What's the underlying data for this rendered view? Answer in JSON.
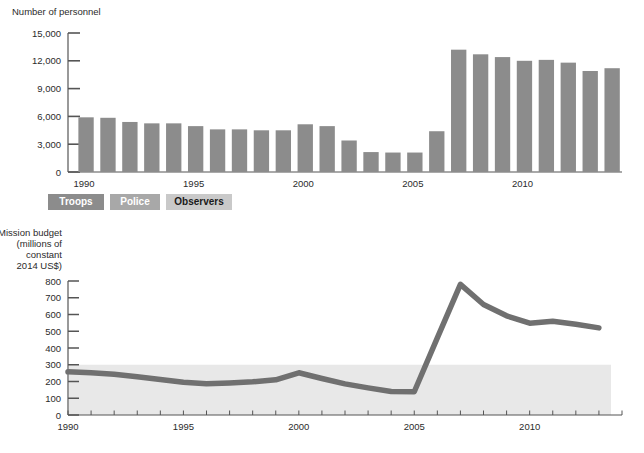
{
  "figure": {
    "background": "#ffffff",
    "bar_color": "#8c8c8c",
    "line_color": "#707070",
    "band_color": "#e8e8e8",
    "axis_color": "#555555"
  },
  "legend": {
    "items": [
      {
        "label": "Troops",
        "bg": "#8c8c8c",
        "fg": "#ffffff"
      },
      {
        "label": "Police",
        "bg": "#a8a8a8",
        "fg": "#ffffff"
      },
      {
        "label": "Observers",
        "bg": "#c9c9c9",
        "fg": "#1a1a1a"
      }
    ]
  },
  "chart_data": [
    {
      "type": "bar",
      "title": "Number of personnel",
      "xlabel": "",
      "ylabel": "Number of personnel",
      "ylim": [
        0,
        15000
      ],
      "yticks": [
        0,
        3000,
        6000,
        9000,
        12000,
        15000
      ],
      "ytick_labels": [
        "0",
        "3,000",
        "6,000",
        "9,000",
        "12,000",
        "15,000"
      ],
      "xticks": [
        1990,
        1995,
        2000,
        2005,
        2010
      ],
      "xtick_labels": [
        "1990",
        "1995",
        "2000",
        "2005",
        "2010"
      ],
      "xlim": [
        1989.4,
        2014.0
      ],
      "grid": false,
      "legend_position": "below-axis",
      "categories": [
        1990,
        1991,
        1992,
        1993,
        1994,
        1995,
        1996,
        1997,
        1998,
        1999,
        2000,
        2001,
        2002,
        2003,
        2004,
        2005,
        2006,
        2007,
        2008,
        2009,
        2010,
        2011,
        2012,
        2013
      ],
      "values": [
        5900,
        5850,
        5400,
        5250,
        5250,
        4950,
        4600,
        4600,
        4500,
        4500,
        5150,
        4950,
        3400,
        2150,
        2100,
        2100,
        4400,
        13200,
        12700,
        12400,
        12000,
        12100,
        11800,
        10900,
        11200
      ]
    },
    {
      "type": "line",
      "title": "Mission budget (millions of constant 2014 US$)",
      "ylabel_lines": [
        "Mission budget",
        "(millions of",
        "constant",
        "2014 US$)"
      ],
      "ylim": [
        0,
        800
      ],
      "yticks": [
        0,
        100,
        200,
        300,
        400,
        500,
        600,
        700,
        800
      ],
      "ytick_labels": [
        "0",
        "100",
        "200",
        "300",
        "400",
        "500",
        "600",
        "700",
        "800"
      ],
      "xticks": [
        1990,
        1995,
        2000,
        2005,
        2010
      ],
      "xtick_labels": [
        "1990",
        "1995",
        "2000",
        "2005",
        "2010"
      ],
      "xlim": [
        1990,
        2014
      ],
      "grid": false,
      "shaded_band": {
        "from": 0,
        "to": 300,
        "color": "#e8e8e8"
      },
      "x": [
        1990,
        1991,
        1992,
        1993,
        1994,
        1995,
        1996,
        1997,
        1998,
        1999,
        2000,
        2001,
        2002,
        2003,
        2004,
        2005,
        2006,
        2007,
        2008,
        2009,
        2010,
        2011,
        2012,
        2013
      ],
      "values": [
        258,
        252,
        243,
        228,
        212,
        196,
        186,
        191,
        198,
        210,
        252,
        218,
        186,
        162,
        140,
        139,
        460,
        780,
        660,
        592,
        548,
        560,
        542,
        520
      ]
    }
  ]
}
